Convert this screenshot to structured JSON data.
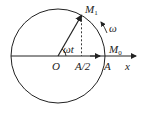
{
  "diagram": {
    "type": "rotating-vector-circle",
    "labels": {
      "origin": "O",
      "half_amplitude": "A/2",
      "amplitude": "A",
      "axis": "x",
      "point_start": "M",
      "point_start_sub": "0",
      "point_end": "M",
      "point_end_sub": "1",
      "angular_velocity": "ω",
      "angle": "ωt"
    },
    "colors": {
      "stroke": "#222222",
      "background": "#ffffff"
    }
  }
}
